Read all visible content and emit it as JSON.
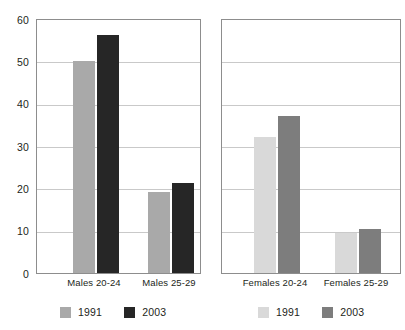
{
  "chart_data": {
    "type": "bar",
    "title": "",
    "xlabel": "",
    "ylabel": "",
    "ylim": [
      0,
      60
    ],
    "yticks": [
      0,
      10,
      20,
      30,
      40,
      50,
      60
    ],
    "grid": true,
    "legend_position": "bottom",
    "panels": [
      {
        "name": "males-panel",
        "categories": [
          "Males 20-24",
          "Males 25-29"
        ],
        "series": [
          {
            "name": "1991",
            "color": "#a9a9a9",
            "values": [
              50.3,
              19.3
            ]
          },
          {
            "name": "2003",
            "color": "#262626",
            "values": [
              56.5,
              21.3
            ]
          }
        ]
      },
      {
        "name": "females-panel",
        "categories": [
          "Females 20-24",
          "Females 25-29"
        ],
        "series": [
          {
            "name": "1991",
            "color": "#d9d9d9",
            "values": [
              32.3,
              9.5
            ]
          },
          {
            "name": "2003",
            "color": "#7d7d7d",
            "values": [
              37.3,
              10.5
            ]
          }
        ]
      }
    ]
  },
  "axis": {
    "tick_60": "60",
    "tick_50": "50",
    "tick_40": "40",
    "tick_30": "30",
    "tick_20": "20",
    "tick_10": "10",
    "tick_0": "0"
  },
  "labels": {
    "males_20_24": "Males 20-24",
    "males_25_29": "Males 25-29",
    "females_20_24": "Females 20-24",
    "females_25_29": "Females 25-29"
  },
  "legend_left": {
    "item_1991": "1991",
    "item_2003": "2003"
  },
  "legend_right": {
    "item_1991": "1991",
    "item_2003": "2003"
  }
}
